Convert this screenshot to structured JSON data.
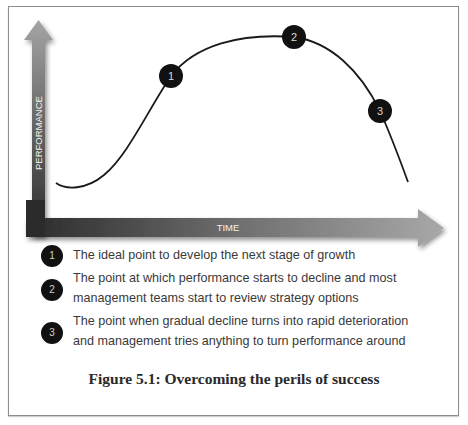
{
  "figure": {
    "caption": "Figure 5.1: Overcoming the perils of success",
    "axes": {
      "y_label": "PERFORMANCE",
      "x_label": "TIME"
    },
    "curve": {
      "description": "S-shaped growth curve that peaks then declines sharply",
      "points_relative": [
        [
          0.0,
          0.05
        ],
        [
          0.05,
          0.0
        ],
        [
          0.15,
          0.2
        ],
        [
          0.33,
          0.7
        ],
        [
          0.47,
          0.9
        ],
        [
          0.67,
          0.96
        ],
        [
          0.8,
          0.75
        ],
        [
          0.92,
          0.45
        ],
        [
          1.0,
          0.03
        ]
      ]
    },
    "markers": [
      {
        "number": "1",
        "position": 0.33
      },
      {
        "number": "2",
        "position": 0.67
      },
      {
        "number": "3",
        "position": 0.92
      }
    ],
    "legend": [
      {
        "number": "1",
        "lines": [
          "The ideal point to develop the next stage of growth"
        ]
      },
      {
        "number": "2",
        "lines": [
          "The point at which performance starts to decline and most",
          "management teams start to review strategy options"
        ]
      },
      {
        "number": "3",
        "lines": [
          "The point when gradual decline turns into rapid deterioration",
          "and management tries anything to turn performance around"
        ]
      }
    ],
    "colors": {
      "curve": "#1a1a1a",
      "marker_fill": "#111111",
      "arrow_dark": "#2b2b2b",
      "arrow_light": "#9a9a9a",
      "text": "#3a3a3a"
    }
  }
}
